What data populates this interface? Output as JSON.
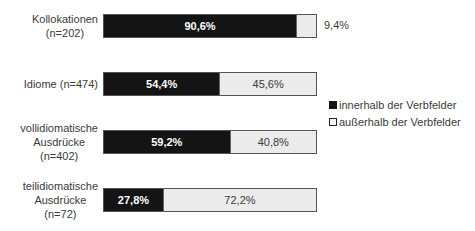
{
  "chart_data": {
    "type": "bar",
    "orientation": "horizontal",
    "stacked": true,
    "normalized_percent": true,
    "title": "",
    "xlabel": "",
    "ylabel": "",
    "xlim": [
      0,
      100
    ],
    "grid": false,
    "legend_position": "right",
    "categories": [
      "Kollokationen (n=202)",
      "Idiome (n=474)",
      "vollidiomatische Ausdrücke (n=402)",
      "teilidiomatische Ausdrücke (n=72)"
    ],
    "series": [
      {
        "name": "innerhalb der Verbfelder",
        "color": "#141414",
        "values": [
          90.6,
          54.4,
          59.2,
          27.8
        ]
      },
      {
        "name": "außerhalb der Verbfelder",
        "color": "#ebebeb",
        "values": [
          9.4,
          45.6,
          40.8,
          72.2
        ]
      }
    ]
  },
  "rows": [
    {
      "label_lines": [
        "Kollokationen",
        "(n=202)"
      ],
      "inner": 90.6,
      "outer": 9.4,
      "inner_text": "90,6%",
      "outer_text": "9,4%"
    },
    {
      "label_lines": [
        "Idiome (n=474)"
      ],
      "inner": 54.4,
      "outer": 45.6,
      "inner_text": "54,4%",
      "outer_text": "45,6%"
    },
    {
      "label_lines": [
        "vollidiomatische",
        "Ausdrücke",
        "(n=402)"
      ],
      "inner": 59.2,
      "outer": 40.8,
      "inner_text": "59,2%",
      "outer_text": "40,8%"
    },
    {
      "label_lines": [
        "teilidiomatische",
        "Ausdrücke",
        "(n=72)"
      ],
      "inner": 27.8,
      "outer": 72.2,
      "inner_text": "27,8%",
      "outer_text": "72,2%"
    }
  ],
  "legend": {
    "items": [
      {
        "label": "innerhalb der Verbfelder"
      },
      {
        "label": "außerhalb der Verbfelder"
      }
    ]
  }
}
